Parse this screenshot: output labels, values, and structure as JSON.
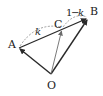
{
  "diagram": {
    "type": "vector-diagram",
    "points": {
      "O": {
        "label": "O",
        "x": 51,
        "y": 74
      },
      "A": {
        "label": "A",
        "x": 19,
        "y": 48
      },
      "B": {
        "label": "B",
        "x": 88,
        "y": 18
      },
      "C": {
        "label": "C",
        "x": 62,
        "y": 29
      }
    },
    "segment_labels": {
      "AC": "k",
      "CB_one": "1",
      "CB_minus": "−",
      "CB_k": "k"
    },
    "colors": {
      "stroke": "#2a2a2a",
      "light_stroke": "#6a6a6a",
      "dashed": "#888888"
    }
  }
}
